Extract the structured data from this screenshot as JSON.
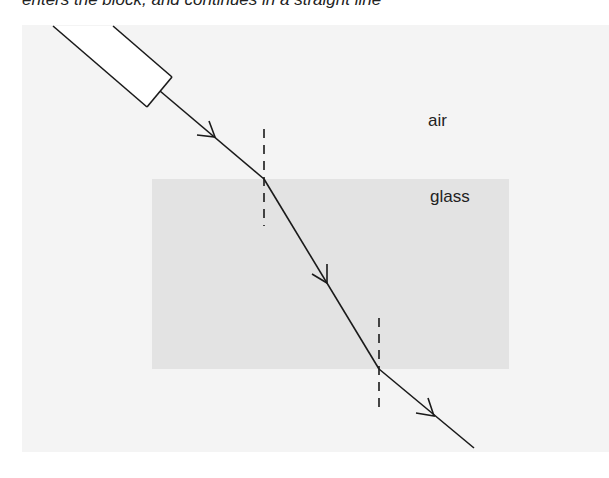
{
  "caption": "enters the block, and continues in a straight line",
  "labels": {
    "air": "air",
    "glass": "glass"
  },
  "colors": {
    "background_panel": "#f4f4f4",
    "glass_block": "#e3e3e3",
    "ray": "#1a1a1a"
  },
  "diagram": {
    "ray_box": {
      "description": "ray box light source",
      "angle": "diagonal upper-left"
    },
    "incident_ray": {
      "from": [
        162,
        92
      ],
      "to": [
        264,
        179
      ]
    },
    "refracted_ray": {
      "from": [
        264,
        179
      ],
      "to": [
        379,
        369
      ]
    },
    "emergent_ray": {
      "from": [
        379,
        369
      ],
      "to": [
        474,
        448
      ]
    },
    "normals": [
      {
        "x": 264,
        "y1": 129,
        "y2": 226
      },
      {
        "x": 379,
        "y1": 318,
        "y2": 414
      }
    ]
  }
}
